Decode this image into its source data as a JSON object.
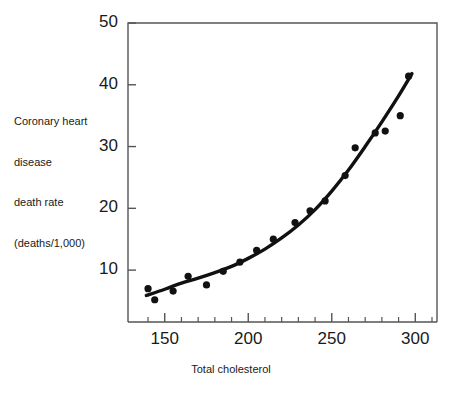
{
  "chart_data": {
    "type": "scatter",
    "title": "",
    "xlabel": "Total cholesterol",
    "ylabel": "Coronary heart disease death rate (deaths/1,000)",
    "ylabel_lines": [
      "Coronary heart",
      "disease",
      "death rate",
      "(deaths/1,000)"
    ],
    "xlim": [
      128,
      313
    ],
    "ylim": [
      1.6,
      50
    ],
    "grid": false,
    "legend": null,
    "xticks": [
      150,
      200,
      250,
      300
    ],
    "xtick_labels": [
      "150",
      "200",
      "250",
      "300"
    ],
    "xminor_ticks": [
      140,
      160,
      170,
      180,
      190,
      210,
      220,
      230,
      240,
      260,
      270,
      280,
      290,
      310
    ],
    "yticks": [
      10,
      20,
      30,
      40,
      50
    ],
    "ytick_labels": [
      "10",
      "20",
      "30",
      "40",
      "50"
    ],
    "marker_color": "#111111",
    "line_color": "#111111",
    "frame_color": "#555555",
    "points": [
      {
        "x": 140,
        "y": 7.0
      },
      {
        "x": 144,
        "y": 5.2
      },
      {
        "x": 155,
        "y": 6.6
      },
      {
        "x": 164,
        "y": 9.0
      },
      {
        "x": 175,
        "y": 7.6
      },
      {
        "x": 185,
        "y": 9.8
      },
      {
        "x": 195,
        "y": 11.3
      },
      {
        "x": 205,
        "y": 13.2
      },
      {
        "x": 215,
        "y": 15.0
      },
      {
        "x": 228,
        "y": 17.7
      },
      {
        "x": 237,
        "y": 19.6
      },
      {
        "x": 246,
        "y": 21.2
      },
      {
        "x": 258,
        "y": 25.3
      },
      {
        "x": 264,
        "y": 29.8
      },
      {
        "x": 276,
        "y": 32.2
      },
      {
        "x": 282,
        "y": 32.5
      },
      {
        "x": 291,
        "y": 35.0
      },
      {
        "x": 296,
        "y": 41.4
      }
    ],
    "fit_curve": [
      {
        "x": 139,
        "y": 5.9
      },
      {
        "x": 150,
        "y": 6.9
      },
      {
        "x": 160,
        "y": 7.9
      },
      {
        "x": 170,
        "y": 8.7
      },
      {
        "x": 180,
        "y": 9.6
      },
      {
        "x": 190,
        "y": 10.6
      },
      {
        "x": 200,
        "y": 11.9
      },
      {
        "x": 210,
        "y": 13.4
      },
      {
        "x": 220,
        "y": 15.2
      },
      {
        "x": 230,
        "y": 17.3
      },
      {
        "x": 240,
        "y": 19.8
      },
      {
        "x": 250,
        "y": 22.8
      },
      {
        "x": 260,
        "y": 26.2
      },
      {
        "x": 270,
        "y": 30.0
      },
      {
        "x": 280,
        "y": 34.0
      },
      {
        "x": 290,
        "y": 38.2
      },
      {
        "x": 298,
        "y": 41.8
      }
    ]
  }
}
